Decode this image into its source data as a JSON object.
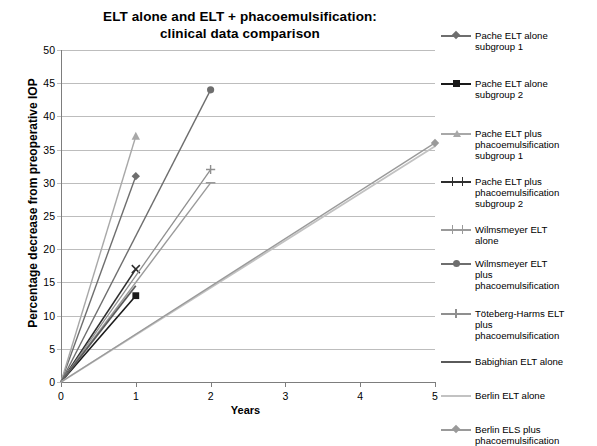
{
  "chart_data": {
    "type": "line",
    "title": "ELT alone and ELT + phacoemulsification: clinical data comparison",
    "title_line1": "ELT alone and ELT + phacoemulsification:",
    "title_line2": "clinical data comparison",
    "xlabel": "Years",
    "ylabel": "Percentage decrease from preoperative IOP",
    "xlim": [
      0,
      5
    ],
    "ylim": [
      0,
      50
    ],
    "xticks": [
      "0",
      "1",
      "2",
      "3",
      "4",
      "5"
    ],
    "yticks": [
      "0",
      "5",
      "10",
      "15",
      "20",
      "25",
      "30",
      "35",
      "40",
      "45",
      "50"
    ],
    "grid": "horizontal",
    "legend_position": "right",
    "series": [
      {
        "name": "Pache ELT alone subgroup 1",
        "label_line1": "Pache ELT alone",
        "label_line2": "subgroup 1",
        "color": "#6e6e6e",
        "marker": "diamond",
        "width": 1.4,
        "x": [
          0,
          1
        ],
        "y": [
          0,
          31
        ]
      },
      {
        "name": "Pache ELT alone subgroup 2",
        "label_line1": "Pache ELT alone",
        "label_line2": "subgroup 2",
        "color": "#1a1a1a",
        "marker": "square",
        "width": 1.6,
        "x": [
          0,
          1
        ],
        "y": [
          0,
          13
        ]
      },
      {
        "name": "Pache ELT plus phacoemulsification subgroup 1",
        "label_line1": "Pache ELT plus",
        "label_line2": "phacoemulsification",
        "label_line3": "subgroup 1",
        "color": "#a8a8a8",
        "marker": "triangle",
        "width": 1.4,
        "x": [
          0,
          1
        ],
        "y": [
          0,
          37
        ]
      },
      {
        "name": "Pache ELT plus phacoemulsification subgroup 2",
        "label_line1": "Pache ELT plus",
        "label_line2": "phacoemulsification",
        "label_line3": "subgroup 2",
        "color": "#2e2e2e",
        "marker": "cross",
        "width": 1.6,
        "x": [
          0,
          1
        ],
        "y": [
          0,
          17
        ]
      },
      {
        "name": "Wilmsmeyer ELT alone",
        "label_line1": "Wilmsmeyer ELT",
        "label_line2": "alone",
        "color": "#9a9a9a",
        "marker": "dash",
        "width": 1.4,
        "x": [
          0,
          2
        ],
        "y": [
          0,
          30
        ]
      },
      {
        "name": "Wilmsmeyer ELT plus phacoemulsification",
        "label_line1": "Wilmsmeyer ELT",
        "label_line2": "plus",
        "label_line3": "phacoemulsification",
        "color": "#6e6e6e",
        "marker": "circle",
        "width": 1.4,
        "x": [
          0,
          2
        ],
        "y": [
          0,
          44
        ]
      },
      {
        "name": "Töteberg-Harms ELT plus phacoemulsification",
        "label_line1": "Töteberg-Harms ELT",
        "label_line2": "plus",
        "label_line3": "phacoemulsification",
        "color": "#8f8f8f",
        "marker": "plus",
        "width": 1.3,
        "x": [
          0,
          2
        ],
        "y": [
          0,
          32
        ]
      },
      {
        "name": "Babighian ELT alone",
        "label_line1": "Babighian ELT alone",
        "color": "#5a5a5a",
        "marker": "none",
        "width": 1.8,
        "x": [
          0,
          1
        ],
        "y": [
          0,
          14.5
        ]
      },
      {
        "name": "Berlin ELT alone",
        "label_line1": "Berlin ELT alone",
        "color": "#c2c2c2",
        "marker": "none",
        "width": 1.8,
        "x": [
          0,
          5
        ],
        "y": [
          0,
          35.5
        ]
      },
      {
        "name": "Berlin ELS plus phacoemulsification",
        "label_line1": "Berlin ELS plus",
        "label_line2": "phacoemulsification",
        "color": "#9a9a9a",
        "marker": "diamond",
        "width": 1.4,
        "x": [
          0,
          5
        ],
        "y": [
          0,
          36
        ]
      }
    ]
  }
}
